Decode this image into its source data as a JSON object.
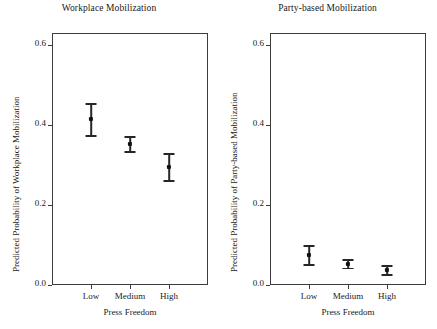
{
  "figure": {
    "axis_title": "Press Freedom",
    "y_ticks": [
      "0.0",
      "0.2",
      "0.4",
      "0.6"
    ],
    "x_categories": [
      "Low",
      "Medium",
      "High"
    ]
  },
  "panels": [
    {
      "id": "workplace",
      "title": "Workplace Mobilization",
      "ylabel": "Predicted Probability of Workplace Mobilization"
    },
    {
      "id": "party",
      "title": "Party-based Mobilization",
      "ylabel": "Predicted Probability of Party-based Mobilization"
    }
  ],
  "chart_data": [
    {
      "type": "scatter",
      "title": "Workplace Mobilization",
      "xlabel": "Press Freedom",
      "ylabel": "Predicted Probability of Workplace Mobilization",
      "categories": [
        "Low",
        "Medium",
        "High"
      ],
      "values": [
        0.415,
        0.352,
        0.295
      ],
      "error_low": [
        0.375,
        0.335,
        0.262
      ],
      "error_high": [
        0.455,
        0.372,
        0.33
      ],
      "ylim": [
        0.0,
        0.63
      ],
      "yticks": [
        0.0,
        0.2,
        0.4,
        0.6
      ],
      "grid": false,
      "legend": "none",
      "marker": "point-with-error-bars"
    },
    {
      "type": "scatter",
      "title": "Party-based Mobilization",
      "xlabel": "Press Freedom",
      "ylabel": "Predicted Probability of Party-based Mobilization",
      "categories": [
        "Low",
        "Medium",
        "High"
      ],
      "values": [
        0.075,
        0.053,
        0.037
      ],
      "error_low": [
        0.052,
        0.043,
        0.027
      ],
      "error_high": [
        0.1,
        0.065,
        0.05
      ],
      "ylim": [
        0.0,
        0.63
      ],
      "yticks": [
        0.0,
        0.2,
        0.4,
        0.6
      ],
      "grid": false,
      "legend": "none",
      "marker": "point-with-error-bars"
    }
  ]
}
